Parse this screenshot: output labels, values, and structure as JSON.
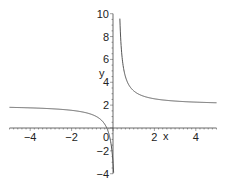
{
  "chart_data": {
    "type": "line",
    "title": "",
    "xlabel": "x",
    "ylabel": "y",
    "xlim": [
      -5,
      5
    ],
    "ylim": [
      -4,
      10
    ],
    "grid": false,
    "legend": null,
    "x_ticks": [
      -4,
      -2,
      0,
      2,
      4
    ],
    "x_tick_labels": [
      "−4",
      "−2",
      "0",
      "2",
      "4"
    ],
    "y_ticks": [
      -4,
      -2,
      2,
      4,
      6,
      8,
      10
    ],
    "y_tick_labels": [
      "−4",
      "−2",
      "2",
      "4",
      "6",
      "8",
      "10"
    ],
    "series": [
      {
        "name": "y = 2 + 1/(x - 0.2)",
        "color": "#555555",
        "vertical_asymptote": 0.2,
        "horizontal_asymptote": 2,
        "x": [
          -5,
          -4,
          -3,
          -2,
          -1.5,
          -1,
          -0.5,
          -0.3,
          -0.1,
          0.0,
          0.05,
          0.28,
          0.3,
          0.4,
          0.6,
          1,
          1.5,
          2,
          3,
          4,
          5
        ],
        "y": [
          1.81,
          1.76,
          1.69,
          1.55,
          1.41,
          1.17,
          0.57,
          0.0,
          -1.33,
          -3.0,
          -4.0,
          10.0,
          12.0,
          7.0,
          4.5,
          3.25,
          2.77,
          2.56,
          2.36,
          2.26,
          2.21
        ]
      }
    ]
  }
}
